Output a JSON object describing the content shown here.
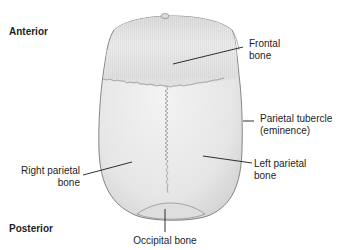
{
  "diagram": {
    "orientation": {
      "anterior": "Anterior",
      "posterior": "Posterior"
    },
    "labels": {
      "frontal_1": "Frontal",
      "frontal_2": "bone",
      "tubercle_1": "Parietal tubercle",
      "tubercle_2": "(eminence)",
      "right_parietal_1": "Right parietal",
      "right_parietal_2": "bone",
      "left_parietal_1": "Left parietal",
      "left_parietal_2": "bone",
      "occipital": "Occipital bone"
    },
    "colors": {
      "bone_fill": "#e9e9e9",
      "frontal_fill": "#e2e2e2",
      "outline": "#6a6a6a",
      "suture": "#8a8a8a",
      "leader": "#1a1a1a"
    }
  }
}
